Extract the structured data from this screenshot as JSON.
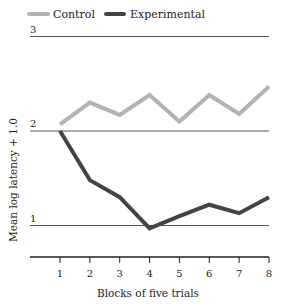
{
  "chart_data": {
    "type": "line",
    "title": "",
    "xlabel": "Blocks of five trials",
    "ylabel": "Mean log latency + 1.0",
    "x": [
      1,
      2,
      3,
      4,
      5,
      6,
      7,
      8
    ],
    "x_tick_labels": [
      "1",
      "2",
      "3",
      "4",
      "5",
      "6",
      "7",
      "8"
    ],
    "y_tick_labels": [
      "1",
      "2",
      "3"
    ],
    "y_ticks": [
      1,
      2,
      3
    ],
    "ylim": [
      0.67,
      3
    ],
    "xlim": [
      0,
      8
    ],
    "grid": "horizontal",
    "legend_position": "top-left",
    "series": [
      {
        "name": "Control",
        "color": "#b3b3b3",
        "values": [
          2.07,
          2.3,
          2.17,
          2.38,
          2.1,
          2.38,
          2.18,
          2.47
        ]
      },
      {
        "name": "Experimental",
        "color": "#444444",
        "values": [
          2.0,
          1.48,
          1.3,
          0.97,
          1.1,
          1.22,
          1.13,
          1.3
        ]
      }
    ]
  }
}
